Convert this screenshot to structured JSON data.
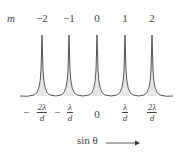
{
  "diagram": {
    "order_label": "m",
    "orders": [
      "−2",
      "−1",
      "0",
      "1",
      "2"
    ],
    "positions": [
      {
        "sign": "−",
        "numerator": "2λ",
        "denominator": "d"
      },
      {
        "sign": "−",
        "numerator": "λ",
        "denominator": "d"
      },
      {
        "plain": "0"
      },
      {
        "sign": "",
        "numerator": "λ",
        "denominator": "d"
      },
      {
        "sign": "",
        "numerator": "2λ",
        "denominator": "d"
      }
    ],
    "axis_label": "sin θ",
    "curve_color": "#555555",
    "fill_color": "#e8e8e8"
  }
}
